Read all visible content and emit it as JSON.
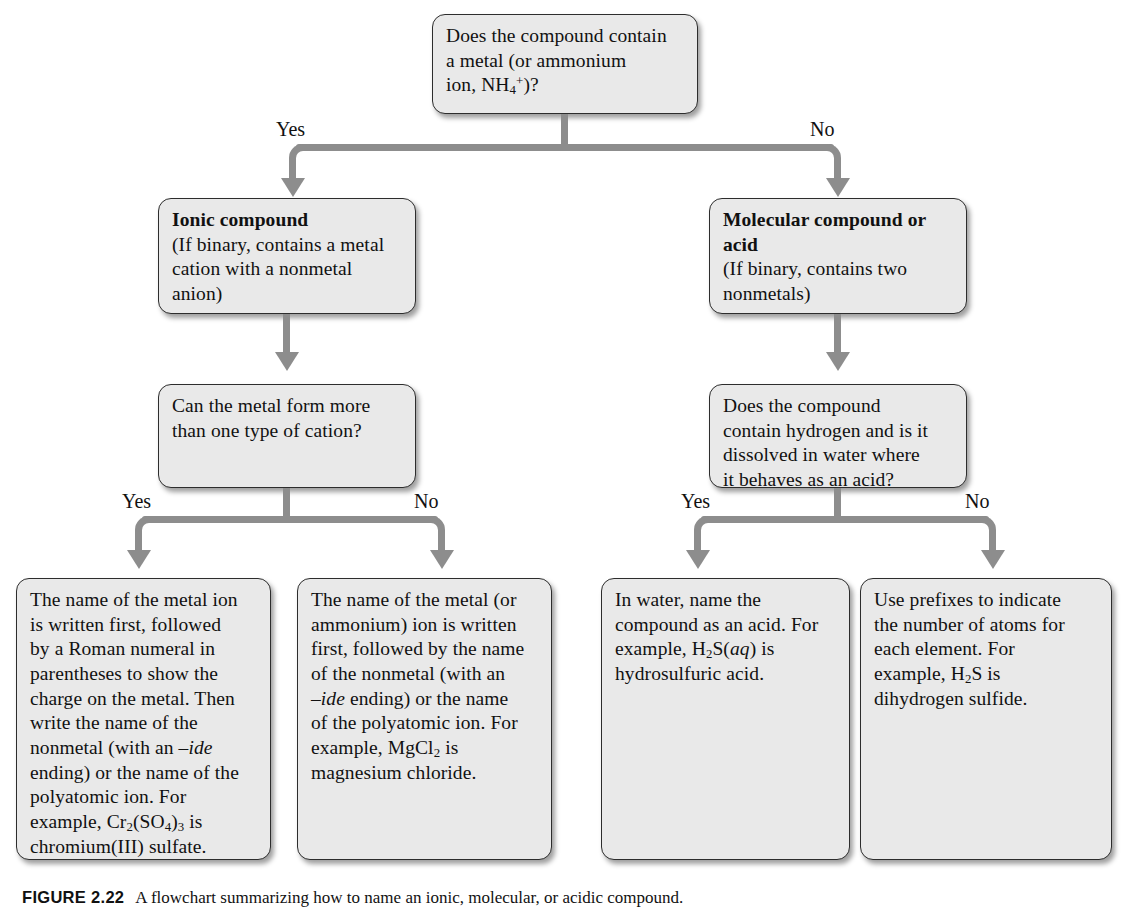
{
  "figure": {
    "number": "FIGURE 2.22",
    "caption": "A flowchart summarizing how to name an ionic, molecular, or acidic compound."
  },
  "colors": {
    "box_fill": "#e9e9e9",
    "box_border": "#2d2d2d",
    "connector": "#8d8d8d",
    "text": "#111111",
    "page_background": "#ffffff"
  },
  "flowchart": {
    "root": {
      "id": "root-question",
      "text_lines": [
        "Does the compound contain",
        "a metal (or ammonium",
        "ion, NH4+)?"
      ],
      "text_plain": "Does the compound contain a metal (or ammonium ion, NH4+)?"
    },
    "branches": {
      "yes": "Yes",
      "no": "No"
    },
    "left": {
      "classification": {
        "id": "ionic-compound",
        "heading": "Ionic compound",
        "body_lines": [
          "(If binary, contains a metal",
          "cation with a nonmetal",
          "anion)"
        ],
        "text_plain": "Ionic compound (If binary, contains a metal cation with a nonmetal anion)"
      },
      "question": {
        "id": "metal-cation-question",
        "text_lines": [
          "Can the metal form more",
          "than one type of cation?"
        ],
        "text_plain": "Can the metal form more than one type of cation?"
      },
      "yes_result": {
        "id": "roman-numeral-rule",
        "text_lines": [
          "The name of the metal ion",
          "is written first, followed",
          "by a Roman numeral in",
          "parentheses to show the",
          "charge on the metal. Then",
          "write the name of the",
          "nonmetal (with an –ide",
          "ending) or the name of the",
          "polyatomic ion. For",
          "example, Cr2(SO4)3 is",
          "chromium(III) sulfate."
        ],
        "text_plain": "The name of the metal ion is written first, followed by a Roman numeral in parentheses to show the charge on the metal. Then write the name of the nonmetal (with an –ide ending) or the name of the polyatomic ion. For example, Cr2(SO4)3 is chromium(III) sulfate."
      },
      "no_result": {
        "id": "simple-ionic-rule",
        "text_lines": [
          "The name of the metal (or",
          "ammonium) ion is written",
          "first, followed by the name",
          "of the nonmetal (with an",
          "–ide ending) or the name",
          "of the polyatomic ion. For",
          "example, MgCl2 is",
          "magnesium chloride."
        ],
        "text_plain": "The name of the metal (or ammonium) ion is written first, followed by the name of the nonmetal (with an –ide ending) or the name of the polyatomic ion. For example, MgCl2 is magnesium chloride."
      }
    },
    "right": {
      "classification": {
        "id": "molecular-compound-or-acid",
        "heading_lines": [
          "Molecular compound or",
          "acid"
        ],
        "body_lines": [
          "(If binary, contains two",
          "nonmetals)"
        ],
        "text_plain": "Molecular compound or acid (If binary, contains two nonmetals)"
      },
      "question": {
        "id": "acid-question",
        "text_lines": [
          "Does the compound",
          "contain hydrogen and is it",
          "dissolved in water where",
          "it behaves as an acid?"
        ],
        "text_plain": "Does the compound contain hydrogen and is it dissolved in water where it behaves as an acid?"
      },
      "yes_result": {
        "id": "acid-naming-rule",
        "text_lines": [
          "In water, name the",
          "compound as an acid. For",
          "example, H2S(aq) is",
          "hydrosulfuric acid."
        ],
        "text_plain": "In water, name the compound as an acid. For example, H2S(aq) is hydrosulfuric acid."
      },
      "no_result": {
        "id": "prefix-naming-rule",
        "text_lines": [
          "Use prefixes to indicate",
          "the number of atoms for",
          "each element. For",
          "example, H2S is",
          "dihydrogen sulfide."
        ],
        "text_plain": "Use prefixes to indicate the number of atoms for each element. For example, H2S is dihydrogen sulfide."
      }
    }
  }
}
